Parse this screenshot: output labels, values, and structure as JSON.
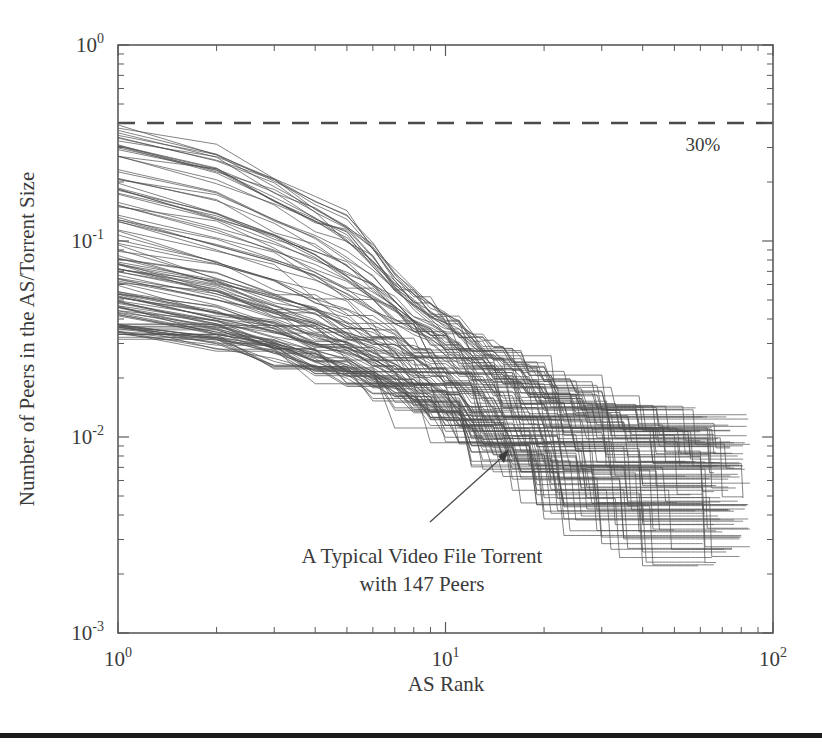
{
  "figure": {
    "domain": "chart",
    "background_color": "#ffffff",
    "line_color": "#4e4e4e",
    "axis_color": "#5a5a5a",
    "text_color": "#3a3a3a",
    "rule_color": "#1c1c1c"
  },
  "axes": {
    "xlabel": "AS Rank",
    "ylabel": "Number of Peers in the AS/Torrent Size",
    "x_tick_labels": [
      {
        "mantissa": "10",
        "exponent": "0",
        "value": 1
      },
      {
        "mantissa": "10",
        "exponent": "1",
        "value": 10
      },
      {
        "mantissa": "10",
        "exponent": "2",
        "value": 100
      }
    ],
    "y_tick_labels": [
      {
        "mantissa": "10",
        "exponent": "0",
        "value": 1
      },
      {
        "mantissa": "10",
        "exponent": "-1",
        "value": 0.1
      },
      {
        "mantissa": "10",
        "exponent": "-2",
        "value": 0.01
      },
      {
        "mantissa": "10",
        "exponent": "-3",
        "value": 0.001
      }
    ]
  },
  "annotations": {
    "threshold_label": "30%",
    "callout_line1": "A Typical Video File Torrent",
    "callout_line2": "with 147 Peers"
  },
  "chart_data": {
    "type": "line",
    "title": "",
    "xlabel": "AS Rank",
    "ylabel": "Number of Peers in the AS/Torrent Size",
    "xscale": "log",
    "yscale": "log",
    "xlim": [
      1,
      100
    ],
    "ylim": [
      0.001,
      1
    ],
    "grid": false,
    "legend": "none",
    "x_ticks": [
      1,
      10,
      100
    ],
    "y_ticks": [
      1,
      0.1,
      0.01,
      0.001
    ],
    "threshold": {
      "value": 0.4,
      "label": "30%",
      "style": "dashed"
    },
    "callout": {
      "text": [
        "A Typical Video File Torrent",
        "with 147 Peers"
      ],
      "target_x": 15,
      "target_y": 0.0085
    },
    "series_summary": {
      "series_count": 120,
      "x_start": 1,
      "x_end_range": [
        40,
        85
      ],
      "y_start_range": [
        0.033,
        0.4
      ],
      "y_end_range": [
        0.0018,
        0.0105
      ],
      "envelope_upper": {
        "x": [
          1,
          2,
          3,
          4,
          5,
          6,
          7,
          8,
          10,
          12,
          15,
          20,
          25,
          30,
          40,
          50,
          60,
          70,
          85
        ],
        "y": [
          0.4,
          0.3,
          0.22,
          0.17,
          0.135,
          0.1,
          0.072,
          0.055,
          0.042,
          0.034,
          0.027,
          0.021,
          0.018,
          0.016,
          0.0135,
          0.012,
          0.011,
          0.0105,
          0.0102
        ]
      },
      "envelope_median": {
        "x": [
          1,
          2,
          3,
          4,
          5,
          6,
          7,
          8,
          10,
          12,
          15,
          20,
          25,
          30,
          40,
          50,
          60,
          70,
          85
        ],
        "y": [
          0.092,
          0.069,
          0.055,
          0.046,
          0.04,
          0.035,
          0.031,
          0.028,
          0.024,
          0.02,
          0.0165,
          0.0135,
          0.0118,
          0.0105,
          0.0088,
          0.0078,
          0.0072,
          0.0068,
          0.0065
        ]
      },
      "envelope_lower": {
        "x": [
          1,
          2,
          3,
          4,
          5,
          6,
          7,
          8,
          10,
          12,
          15,
          20,
          25,
          30,
          40,
          50,
          60,
          70,
          85
        ],
        "y": [
          0.033,
          0.029,
          0.025,
          0.022,
          0.02,
          0.018,
          0.016,
          0.0145,
          0.012,
          0.01,
          0.008,
          0.0058,
          0.0045,
          0.0038,
          0.003,
          0.0026,
          0.0024,
          0.0022,
          0.0021
        ]
      }
    }
  }
}
